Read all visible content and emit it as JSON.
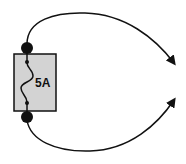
{
  "diagram": {
    "type": "fuse-circuit",
    "fuse": {
      "rating_label": "5A",
      "body_color": "#d3d3d3",
      "stroke_color": "#111111"
    },
    "connections": [
      {
        "name": "top-lead",
        "direction": "to-right-terminal-upper",
        "arrow": true
      },
      {
        "name": "bottom-lead",
        "direction": "to-right-terminal-lower",
        "arrow": true
      }
    ]
  }
}
